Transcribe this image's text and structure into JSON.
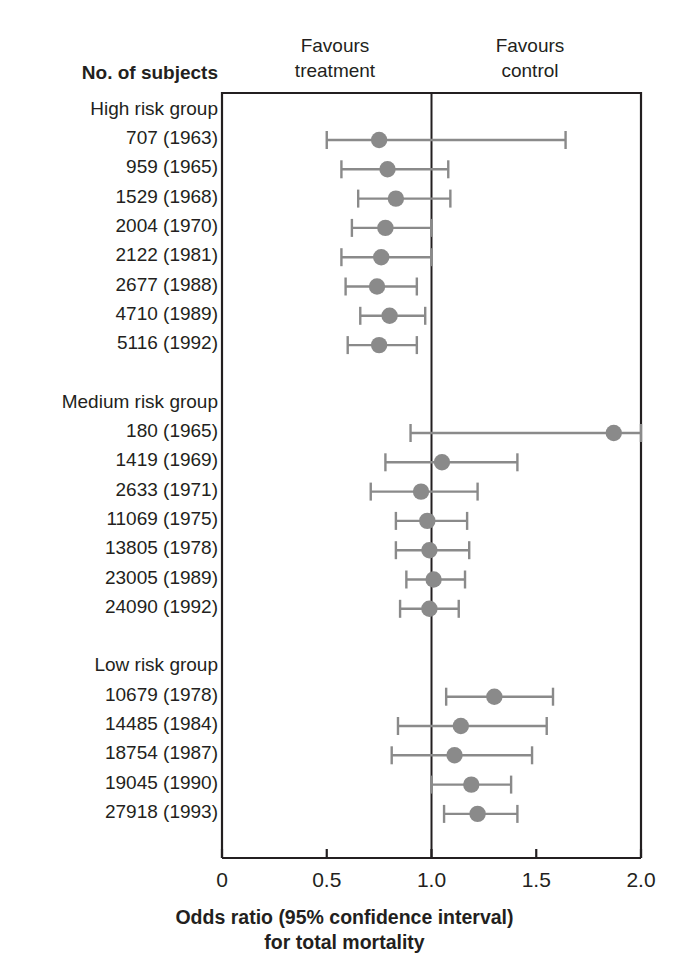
{
  "header": {
    "subjects_label": "No. of subjects",
    "favours_treatment": "Favours\ntreatment",
    "favours_treatment_line1": "Favours",
    "favours_treatment_line2": "treatment",
    "favours_control_line1": "Favours",
    "favours_control_line2": "control"
  },
  "caption": {
    "line1": "Odds ratio (95% confidence interval)",
    "line2": "for total mortality"
  },
  "colors": {
    "marker": "#8a8a8a",
    "whisker": "#8a8a8a",
    "axis": "#231f20",
    "text": "#231f20",
    "background": "#ffffff"
  },
  "chart_data": {
    "type": "forest",
    "title": "",
    "xlabel": "Odds ratio (95% confidence interval) for total mortality",
    "ylabel": "No. of subjects",
    "xlim": [
      0,
      2.0
    ],
    "xticks": [
      0,
      0.5,
      1.0,
      1.5,
      2.0
    ],
    "xticklabels": [
      "0",
      "0.5",
      "1.0",
      "1.5",
      "2.0"
    ],
    "null_line": 1.0,
    "grid": false,
    "legend": "none",
    "annotations": [
      "Favours treatment",
      "Favours control"
    ],
    "groups": [
      {
        "name": "High risk group",
        "rows": [
          {
            "label": "707 (1963)",
            "subjects": 707,
            "year": 1963,
            "or": 0.75,
            "ci_low": 0.5,
            "ci_high": 1.64
          },
          {
            "label": "959 (1965)",
            "subjects": 959,
            "year": 1965,
            "or": 0.79,
            "ci_low": 0.57,
            "ci_high": 1.08
          },
          {
            "label": "1529 (1968)",
            "subjects": 1529,
            "year": 1968,
            "or": 0.83,
            "ci_low": 0.65,
            "ci_high": 1.09
          },
          {
            "label": "2004 (1970)",
            "subjects": 2004,
            "year": 1970,
            "or": 0.78,
            "ci_low": 0.62,
            "ci_high": 1.0
          },
          {
            "label": "2122 (1981)",
            "subjects": 2122,
            "year": 1981,
            "or": 0.76,
            "ci_low": 0.57,
            "ci_high": 1.0
          },
          {
            "label": "2677 (1988)",
            "subjects": 2677,
            "year": 1988,
            "or": 0.74,
            "ci_low": 0.59,
            "ci_high": 0.93
          },
          {
            "label": "4710 (1989)",
            "subjects": 4710,
            "year": 1989,
            "or": 0.8,
            "ci_low": 0.66,
            "ci_high": 0.97
          },
          {
            "label": "5116 (1992)",
            "subjects": 5116,
            "year": 1992,
            "or": 0.75,
            "ci_low": 0.6,
            "ci_high": 0.93
          }
        ]
      },
      {
        "name": "Medium risk group",
        "rows": [
          {
            "label": "180 (1965)",
            "subjects": 180,
            "year": 1965,
            "or": 1.87,
            "ci_low": 0.9,
            "ci_high": 2.0
          },
          {
            "label": "1419 (1969)",
            "subjects": 1419,
            "year": 1969,
            "or": 1.05,
            "ci_low": 0.78,
            "ci_high": 1.41
          },
          {
            "label": "2633 (1971)",
            "subjects": 2633,
            "year": 1971,
            "or": 0.95,
            "ci_low": 0.71,
            "ci_high": 1.22
          },
          {
            "label": "11069 (1975)",
            "subjects": 11069,
            "year": 1975,
            "or": 0.98,
            "ci_low": 0.83,
            "ci_high": 1.17
          },
          {
            "label": "13805 (1978)",
            "subjects": 13805,
            "year": 1978,
            "or": 0.99,
            "ci_low": 0.83,
            "ci_high": 1.18
          },
          {
            "label": "23005 (1989)",
            "subjects": 23005,
            "year": 1989,
            "or": 1.01,
            "ci_low": 0.88,
            "ci_high": 1.16
          },
          {
            "label": "24090 (1992)",
            "subjects": 24090,
            "year": 1992,
            "or": 0.99,
            "ci_low": 0.85,
            "ci_high": 1.13
          }
        ]
      },
      {
        "name": "Low risk group",
        "rows": [
          {
            "label": "10679 (1978)",
            "subjects": 10679,
            "year": 1978,
            "or": 1.3,
            "ci_low": 1.07,
            "ci_high": 1.58
          },
          {
            "label": "14485 (1984)",
            "subjects": 14485,
            "year": 1984,
            "or": 1.14,
            "ci_low": 0.84,
            "ci_high": 1.55
          },
          {
            "label": "18754 (1987)",
            "subjects": 18754,
            "year": 1987,
            "or": 1.11,
            "ci_low": 0.81,
            "ci_high": 1.48
          },
          {
            "label": "19045 (1990)",
            "subjects": 19045,
            "year": 1990,
            "or": 1.19,
            "ci_low": 1.0,
            "ci_high": 1.38
          },
          {
            "label": "27918 (1993)",
            "subjects": 27918,
            "year": 1993,
            "or": 1.22,
            "ci_low": 1.06,
            "ci_high": 1.41
          }
        ]
      }
    ]
  }
}
